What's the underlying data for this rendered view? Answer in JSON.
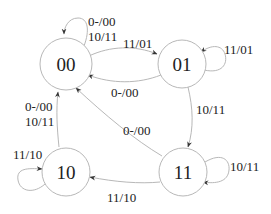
{
  "diagram": {
    "type": "state-machine",
    "colors": {
      "stroke": "#b8b8b8",
      "text": "#222222",
      "background": "#ffffff"
    },
    "states": [
      {
        "id": "00",
        "label": "00"
      },
      {
        "id": "01",
        "label": "01"
      },
      {
        "id": "10",
        "label": "10"
      },
      {
        "id": "11",
        "label": "11"
      }
    ],
    "transitions": [
      {
        "from": "00",
        "to": "00",
        "label_line1": "0-/00",
        "label_line2": "10/11"
      },
      {
        "from": "00",
        "to": "01",
        "label": "11/01"
      },
      {
        "from": "01",
        "to": "01",
        "label": "11/01"
      },
      {
        "from": "01",
        "to": "00",
        "label": "0-/00"
      },
      {
        "from": "01",
        "to": "11",
        "label": "10/11"
      },
      {
        "from": "11",
        "to": "00",
        "label": "0-/00"
      },
      {
        "from": "11",
        "to": "11",
        "label": "10/11"
      },
      {
        "from": "11",
        "to": "10",
        "label": "11/10"
      },
      {
        "from": "10",
        "to": "00",
        "label_line1": "0-/00",
        "label_line2": "10/11"
      },
      {
        "from": "10",
        "to": "10",
        "label": "11/10"
      }
    ]
  }
}
